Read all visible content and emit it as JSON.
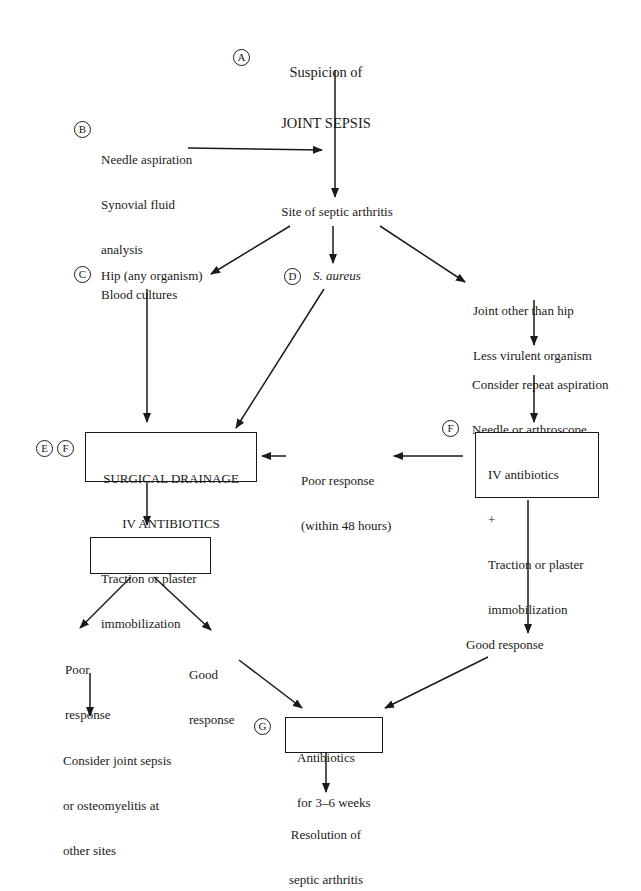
{
  "diagram": {
    "type": "clinical-flowchart",
    "topic": "Management of septic arthritis",
    "nodes": {
      "A": {
        "marker": "A",
        "lines": [
          "Suspicion of",
          "JOINT SEPSIS"
        ]
      },
      "B": {
        "marker": "B",
        "lines": [
          "Needle aspiration",
          "Synovial fluid",
          "analysis",
          "Blood cultures"
        ]
      },
      "site": {
        "lines": [
          "Site of septic arthritis"
        ]
      },
      "C": {
        "marker": "C",
        "lines": [
          "Hip (any organism)"
        ]
      },
      "D": {
        "marker": "D",
        "lines": [
          "S. aureus"
        ]
      },
      "other": {
        "lines": [
          "Joint other than hip",
          "Less virulent organism"
        ]
      },
      "repeat": {
        "lines": [
          "Consider repeat aspiration",
          "Needle or arthroscope"
        ]
      },
      "surgical": {
        "markers": [
          "E",
          "F"
        ],
        "lines": [
          "SURGICAL DRAINAGE",
          "IV ANTIBIOTICS"
        ]
      },
      "poor48": {
        "lines": [
          "Poor response",
          "(within 48 hours)"
        ]
      },
      "ivabx": {
        "marker": "F",
        "lines": [
          "IV antibiotics",
          "+",
          "Traction or plaster",
          "immobilization"
        ]
      },
      "traction": {
        "lines": [
          "Traction or plaster",
          "immobilization"
        ]
      },
      "poor": {
        "lines": [
          "Poor",
          "response"
        ]
      },
      "good_left": {
        "lines": [
          "Good",
          "response"
        ]
      },
      "good_right": {
        "lines": [
          "Good response"
        ]
      },
      "consider_other": {
        "lines": [
          "Consider joint sepsis",
          "or osteomyelitis at",
          "other sites"
        ]
      },
      "G": {
        "marker": "G",
        "lines": [
          "Antibiotics",
          "for 3–6 weeks"
        ]
      },
      "resolution": {
        "lines": [
          "Resolution of",
          "septic arthritis"
        ]
      }
    },
    "edges": [
      [
        "A",
        "site"
      ],
      [
        "B",
        "A-site line"
      ],
      [
        "site",
        "C"
      ],
      [
        "site",
        "D"
      ],
      [
        "site",
        "other"
      ],
      [
        "other",
        "repeat"
      ],
      [
        "repeat",
        "ivabx"
      ],
      [
        "C",
        "surgical"
      ],
      [
        "D",
        "surgical"
      ],
      [
        "ivabx",
        "poor48"
      ],
      [
        "poor48",
        "surgical"
      ],
      [
        "surgical",
        "traction"
      ],
      [
        "traction",
        "poor"
      ],
      [
        "traction",
        "good_left"
      ],
      [
        "poor",
        "consider_other"
      ],
      [
        "good_left",
        "G"
      ],
      [
        "ivabx",
        "good_right"
      ],
      [
        "good_right",
        "G"
      ],
      [
        "G",
        "resolution"
      ]
    ]
  }
}
